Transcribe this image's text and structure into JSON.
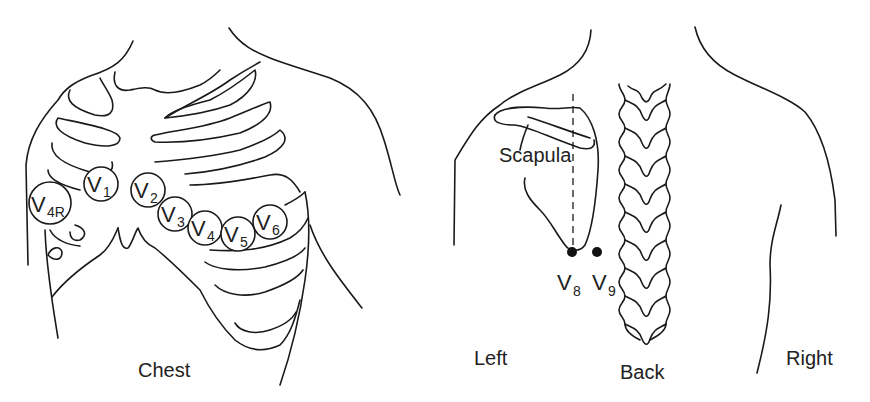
{
  "diagram": {
    "panels": [
      {
        "id": "chest",
        "label": "Chest"
      },
      {
        "id": "back",
        "label": "Back",
        "side_labels": {
          "left": "Left",
          "right": "Right"
        },
        "structure_label": "Scapula"
      }
    ],
    "chest_electrodes": [
      {
        "letter": "V",
        "sub": "4R",
        "cx": 50,
        "cy": 203,
        "r": 21
      },
      {
        "letter": "V",
        "sub": "1",
        "cx": 101,
        "cy": 184,
        "r": 17
      },
      {
        "letter": "V",
        "sub": "2",
        "cx": 148,
        "cy": 190,
        "r": 17
      },
      {
        "letter": "V",
        "sub": "3",
        "cx": 175,
        "cy": 214,
        "r": 17
      },
      {
        "letter": "V",
        "sub": "4",
        "cx": 205,
        "cy": 228,
        "r": 17
      },
      {
        "letter": "V",
        "sub": "5",
        "cx": 238,
        "cy": 234,
        "r": 17
      },
      {
        "letter": "V",
        "sub": "6",
        "cx": 270,
        "cy": 222,
        "r": 17
      }
    ],
    "back_electrodes": [
      {
        "letter": "V",
        "sub": "8",
        "cx": 572,
        "cy": 252
      },
      {
        "letter": "V",
        "sub": "9",
        "cx": 597,
        "cy": 252
      }
    ],
    "colors": {
      "stroke": "#1a1a1a",
      "text": "#222222",
      "background": "#ffffff"
    }
  },
  "labels": {
    "chest": "Chest",
    "back": "Back",
    "left": "Left",
    "right": "Right",
    "scapula": "Scapula",
    "v": "V",
    "s4r": "4R",
    "s1": "1",
    "s2": "2",
    "s3": "3",
    "s4": "4",
    "s5": "5",
    "s6": "6",
    "s8": "8",
    "s9": "9"
  }
}
